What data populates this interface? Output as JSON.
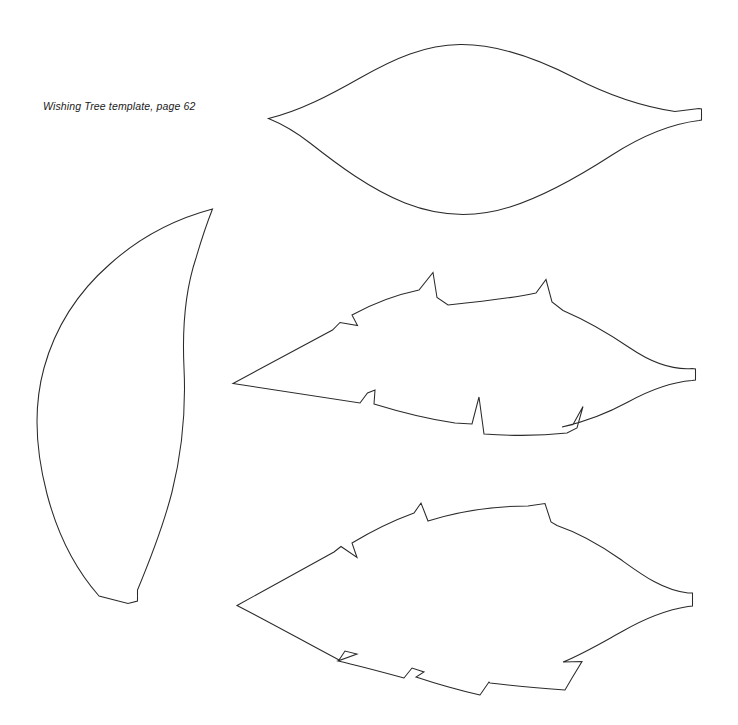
{
  "page": {
    "title": "Wishing Tree template, page 62",
    "background_color": "#ffffff",
    "line_color": "#2b2b2b",
    "width": 738,
    "height": 725
  },
  "caption": {
    "text": "Wishing Tree template, page 62",
    "style": "italic",
    "x": 43,
    "y": 100
  },
  "shapes": [
    {
      "id": "smooth-leaf",
      "name": "Smooth leaf template",
      "position": "top-right",
      "outline_style": "smooth",
      "bounds": {
        "x": 266,
        "y": 44,
        "width": 438,
        "height": 175
      },
      "tips": {
        "left": [
          268,
          118
        ],
        "right": [
          702,
          113
        ]
      },
      "has_stem_tab": true,
      "path": "M268.5,118.5 C300,111 330,95 360,78 C395,58 425,45 460,44.5 C500,44 540,60 575,78 C610,96 645,107 675,111.5 L699,108.5 L701.5,109 L701.5,120 L699,120.5 C670,124 640,137 612,155 C578,177 545,196 510,207 C472,219 438,216 405,203 C370,189 338,165 310,143 C296,132 282,124 268.5,118.5 Z"
    },
    {
      "id": "crescent-leaf",
      "name": "Crescent flame leaf template",
      "position": "left-middle",
      "outline_style": "smooth-crescent",
      "bounds": {
        "x": 36,
        "y": 207,
        "width": 180,
        "height": 400
      },
      "tips": {
        "top": [
          212,
          209
        ],
        "bottom": [
          130,
          604
        ]
      },
      "has_stem_tab": true,
      "path": "M212.5,209 C175,219 140,237 110,264 C78,292 55,328 44,368 C33,408 36,452 47,494 C58,536 77,571 99,596 L128,603.5 L137.5,601 L137.5,590 C150,560 163,527 172,492 C182,452 186,410 184,368 C182,326 186,288 196,258 C201,241 207,223 212.5,209 Z"
    },
    {
      "id": "jagged-leaf-a",
      "name": "Jagged serrated leaf template A",
      "position": "right-middle",
      "outline_style": "serrated",
      "bounds": {
        "x": 232,
        "y": 270,
        "width": 466,
        "height": 160
      },
      "tips": {
        "left": [
          233,
          383
        ],
        "right": [
          697,
          372
        ]
      },
      "has_stem_tab": true,
      "path": "M233,383.5 L332.5,330 L340,322.5 L357.5,325.5 L352,315 C372,304 395,295 419,290 L433,272.5 L437,297.5 L448,305 C478,302 508,299 536,293 L546,279.5 L552,302 L563,310.5 C585,320 608,333 630,348 C652,363 672,370 692,368.5 L695.5,369 L695.5,380 L692,380.5 C672,382 650,390 628,402 C606,414 584,422 562,427 L573,424.5 L583,406.5 L577,428 L567,433 C540,436 512,436 484,434 L479,397 L472,424 L455,423 C427,419 400,412 374,404 L375,390 L367.5,393 L360,403 C317,396 274,390 233,383.5 Z"
    },
    {
      "id": "jagged-leaf-b",
      "name": "Jagged serrated leaf template B",
      "position": "bottom-right",
      "outline_style": "serrated",
      "bounds": {
        "x": 236,
        "y": 498,
        "width": 460,
        "height": 192
      },
      "tips": {
        "left": [
          237,
          605
        ],
        "right": [
          695,
          598
        ]
      },
      "has_stem_tab": true,
      "path": "M237,605.5 L334,552 L341,546.5 L357,557.5 L352,543 C372,531 392,521 414,513 L421,503 L428,521 C460,511 495,506 528,506 L545,503.5 L551,522 L557,525.5 C579,533 600,545 620,559 C641,574 662,590 688,593 L692.5,593 L692.5,606 L688,606.5 C666,610 644,619 623,631 C603,642 583,654 563,662 L582,661.5 L572,678 L565,690 C540,688 515,686 490,683 L489,682 L480,695 C458,690 437,684 416,677 L424,672 L412,668 L404,678 C382,672 360,666 338,661 L357,654 L345,651 L339,660 C305,642 271,623 237,605.5 Z"
    }
  ]
}
